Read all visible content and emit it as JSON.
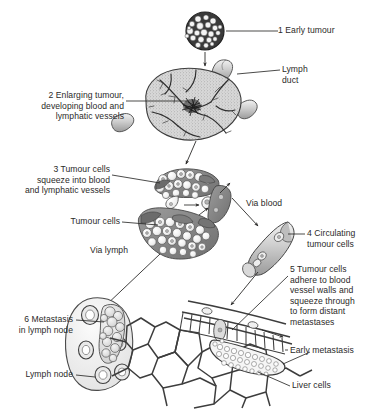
{
  "figure": {
    "background": "#ffffff",
    "ink": "#2b2a29",
    "fill_light": "#d9d9d9",
    "fill_mid": "#a8a8a8",
    "fill_dark": "#6e6e6e"
  },
  "labels": {
    "early_tumour": "1 Early tumour",
    "lymph_duct": "Lymph\nduct",
    "enlarging_tumour": "2 Enlarging tumour,\ndeveloping blood and\nlymphatic vessels",
    "squeeze_in": "3 Tumour cells\nsqueeze into blood\nand lymphatic vessels",
    "tumour_cells": "Tumour cells",
    "via_lymph": "Via lymph",
    "via_blood": "Via blood",
    "circulating": "4 Circulating\ntumour cells",
    "adhere": "5 Tumour cells\nadhere to blood\nvessel walls and\nsqueeze through\nto form distant\nmetastases",
    "early_metastasis": "Early metastasis",
    "liver_cells": "Liver cells",
    "metastasis_node": "6 Metastasis\nin lymph node",
    "lymph_node": "Lymph node"
  },
  "steps": [
    {
      "number": "1",
      "text": "Early tumour"
    },
    {
      "number": "2",
      "text": "Enlarging tumour, developing blood and lymphatic vessels"
    },
    {
      "number": "3",
      "text": "Tumour cells squeeze into blood and lymphatic vessels"
    },
    {
      "number": "4",
      "text": "Circulating tumour cells"
    },
    {
      "number": "5",
      "text": "Tumour cells adhere to blood vessel walls and squeeze through to form distant metastases"
    },
    {
      "number": "6",
      "text": "Metastasis in lymph node"
    }
  ],
  "structures": [
    "early-tumour-cluster",
    "enlarging-tumour",
    "lymph-duct",
    "tumour-cell-clusters",
    "circulating-tumour-cell-vessel",
    "lymph-node",
    "liver-cells",
    "early-metastasis"
  ]
}
